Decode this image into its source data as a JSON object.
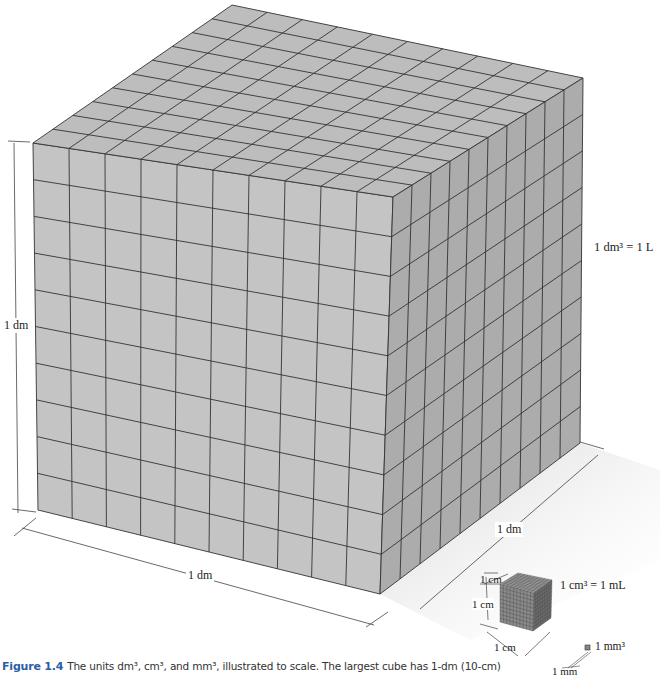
{
  "figure": {
    "number": "Figure 1.4",
    "caption_text": "The units dm³, cm³, and mm³, illustrated to scale. The largest cube has 1-dm (10-cm)"
  },
  "labels": {
    "height_dm": "1 dm",
    "width_dm": "1 dm",
    "depth_dm": "1 dm",
    "dm3_eq": "1 dm³ = 1 L",
    "cm_top": "1 cm",
    "cm_left": "1 cm",
    "cm_bottom": "1 cm",
    "cm3_eq": "1 cm³ = 1 mL",
    "mm3": "1 mm³",
    "mm": "1 mm"
  },
  "cube": {
    "grid_divisions": 10,
    "small_cube_divisions": 10,
    "colors": {
      "front": "#c4c4c4",
      "top": "#bdbdbd",
      "right": "#acacac",
      "grid": "#333333",
      "small_front": "#8a8a8a",
      "small_top": "#a0a0a0",
      "small_right": "#6e6e6e"
    }
  }
}
